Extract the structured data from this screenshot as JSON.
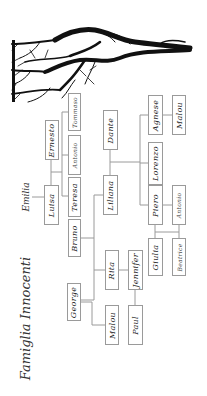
{
  "diagram": {
    "title": "Famiglia Innocenti",
    "orientation": "rotated 90° counter-clockwise (text reads bottom-to-top)",
    "line_color": "#9a9a9a",
    "tree_color": "#111111",
    "root": {
      "name": "Emilia"
    },
    "people": {
      "luisa": "Luisa",
      "ernesto": "Ernesto",
      "tommaso": "Tommaso",
      "antonio1": "Antonio",
      "teresa": "Teresa",
      "bruno": "Bruno",
      "liliana": "Liliana",
      "dante": "Dante",
      "lorenzo": "Lorenzo",
      "agnese": "Agnese",
      "malou1": "Malou",
      "piero": "Piero",
      "antonio2": "Antonio",
      "giulia": "Giulia",
      "beatrice": "Beatrice",
      "rita": "Rita",
      "jennifer": "Jennifer",
      "george": "George",
      "malou2": "Malou",
      "paul": "Paul"
    },
    "relations": [
      {
        "parents": [
          "Emilia"
        ],
        "children": [
          "Luisa"
        ]
      },
      {
        "couple": [
          "Luisa",
          "Ernesto"
        ],
        "children": [
          "Teresa",
          "Antonio",
          "Tommaso"
        ]
      },
      {
        "couple": [
          "Teresa",
          "Bruno"
        ],
        "children": [
          "Liliana",
          "George",
          "Rita"
        ]
      },
      {
        "couple": [
          "Liliana",
          "Dante"
        ],
        "children": [
          "Piero",
          "Lorenzo",
          "Agnese"
        ]
      },
      {
        "couple": [
          "Agnese",
          "Malou"
        ]
      },
      {
        "couple": [
          "Piero",
          "Antonio"
        ],
        "children": [
          "Giulia",
          "Beatrice"
        ]
      },
      {
        "couple": [
          "Rita",
          "Jennifer"
        ]
      },
      {
        "couple": [
          "George",
          "Malou"
        ]
      },
      {
        "couple": [
          "Jennifer",
          "Paul"
        ]
      }
    ]
  }
}
